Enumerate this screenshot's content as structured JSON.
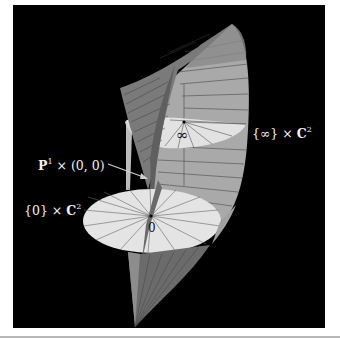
{
  "figure": {
    "background": "#000000",
    "labels": {
      "p1_prefix": "P",
      "p1_sup": "1",
      "p1_suffix": " × (0, 0)",
      "zero_prefix": "{0} × ",
      "zero_bold": "C",
      "zero_sup": "2",
      "inf_prefix": "{∞} × ",
      "inf_bold": "C",
      "inf_sup": "2"
    },
    "point_marks": {
      "origin": "0",
      "infinity": "∞"
    },
    "colors": {
      "surface_dark": "#6e6e6e",
      "surface_mid": "#9a9a9a",
      "surface_light": "#b4b4b4",
      "disc": "#e4e4e4",
      "grid_line": "#4a4a4a",
      "label_text": "#f2f2f2"
    }
  }
}
